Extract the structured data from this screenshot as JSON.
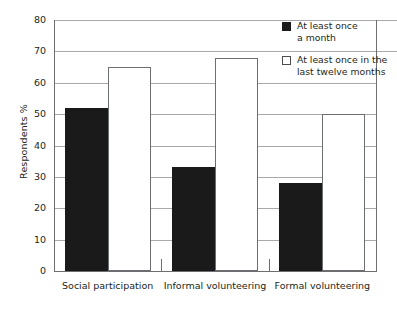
{
  "chart_data": {
    "type": "bar",
    "title": "",
    "xlabel": "",
    "ylabel": "Respondents %",
    "ylim": [
      0,
      80
    ],
    "ytick_step": 10,
    "yticks": [
      "80",
      "70",
      "60",
      "50",
      "40",
      "30",
      "20",
      "10",
      "0"
    ],
    "grid": true,
    "legend_position": "top-right",
    "categories": [
      "Social participation",
      "Informal volunteering",
      "Formal volunteering"
    ],
    "series": [
      {
        "name": "At least once a month",
        "name_line1": "At least once",
        "name_line2": "a month",
        "style": "filled",
        "color": "#1a1a1a",
        "values": [
          52,
          33,
          28
        ]
      },
      {
        "name": "At least once in the last twelve months",
        "name_line1": "At least once in the",
        "name_line2": "last twelve months",
        "style": "hollow",
        "color": "#ffffff",
        "values": [
          65,
          68,
          50
        ]
      }
    ]
  },
  "axis": {
    "line_color": "#6d6e71",
    "grid_color": "#a7a9ac"
  }
}
